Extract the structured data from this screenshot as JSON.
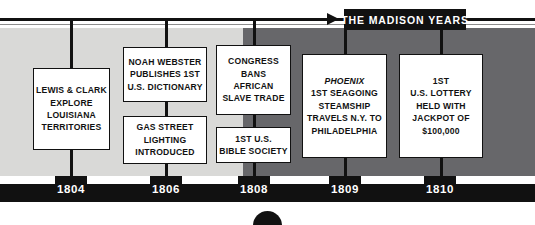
{
  "banner": {
    "label": "THE MADISON YEARS"
  },
  "background": {
    "light_color": "#d9d9d7",
    "dark_color": "#67676a",
    "ink_color": "#111111"
  },
  "events": [
    {
      "id": "lewis-clark",
      "year": "1804",
      "lines": [
        "LEWIS & CLARK",
        "EXPLORE",
        "LOUISIANA",
        "TERRITORIES"
      ],
      "italic_first_line": false
    },
    {
      "id": "noah-webster",
      "year": "1806",
      "lines": [
        "NOAH WEBSTER",
        "PUBLISHES 1ST",
        "U.S. DICTIONARY"
      ],
      "italic_first_line": false
    },
    {
      "id": "gas-street-lighting",
      "year": "1806",
      "lines": [
        "GAS STREET",
        "LIGHTING",
        "INTRODUCED"
      ],
      "italic_first_line": false
    },
    {
      "id": "congress-slave-trade",
      "year": "1808",
      "lines": [
        "CONGRESS",
        "BANS",
        "AFRICAN",
        "SLAVE TRADE"
      ],
      "italic_first_line": false
    },
    {
      "id": "bible-society",
      "year": "1808",
      "lines": [
        "1ST U.S.",
        "BIBLE SOCIETY"
      ],
      "italic_first_line": false
    },
    {
      "id": "phoenix-steamship",
      "year": "1809",
      "lines": [
        "PHOENIX",
        "1ST SEAGOING",
        "STEAMSHIP",
        "TRAVELS N.Y. TO",
        "PHILADELPHIA"
      ],
      "italic_first_line": true
    },
    {
      "id": "us-lottery",
      "year": "1810",
      "lines": [
        "1ST",
        "U.S. LOTTERY",
        "HELD WITH",
        "JACKPOT OF",
        "$100,000"
      ],
      "italic_first_line": false
    }
  ],
  "years": [
    {
      "label": "1804"
    },
    {
      "label": "1806"
    },
    {
      "label": "1808"
    },
    {
      "label": "1809"
    },
    {
      "label": "1810"
    }
  ]
}
